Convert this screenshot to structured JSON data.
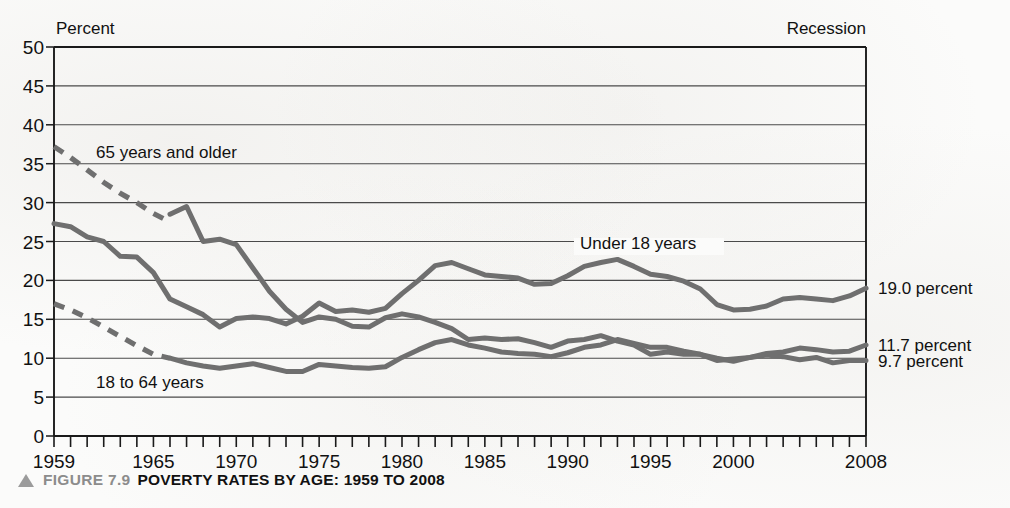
{
  "figure": {
    "marker_icon": "triangle-up-icon",
    "number_label": "FIGURE 7.9",
    "title": "POVERTY RATES BY AGE: 1959 TO 2008"
  },
  "annotations": {
    "y_axis_unit": "Percent",
    "recession_note": "Recession"
  },
  "colors": {
    "page_background": "#fbfbfa",
    "plot_frame": "#1a1a1a",
    "gridline": "#4a4a4a",
    "series_line": "#6f6f6f",
    "text": "#111111",
    "caption_gray": "#8c8c8c"
  },
  "chart_data": {
    "type": "line",
    "title": "POVERTY RATES BY AGE: 1959 TO 2008",
    "xlabel": "",
    "ylabel": "Percent",
    "xlim": [
      1959,
      2008
    ],
    "ylim": [
      0,
      50
    ],
    "ytick_step": 5,
    "grid": true,
    "legend_position": "inline-labels",
    "yticks": [
      0,
      5,
      10,
      15,
      20,
      25,
      30,
      35,
      40,
      45,
      50
    ],
    "xticks_labeled": [
      1959,
      1965,
      1970,
      1975,
      1980,
      1985,
      1990,
      1995,
      2000,
      2008
    ],
    "xticks_all_years": true,
    "x": [
      1959,
      1960,
      1961,
      1962,
      1963,
      1964,
      1965,
      1966,
      1967,
      1968,
      1969,
      1970,
      1971,
      1972,
      1973,
      1974,
      1975,
      1976,
      1977,
      1978,
      1979,
      1980,
      1981,
      1982,
      1983,
      1984,
      1985,
      1986,
      1987,
      1988,
      1989,
      1990,
      1991,
      1992,
      1993,
      1994,
      1995,
      1996,
      1997,
      1998,
      1999,
      2000,
      2001,
      2002,
      2003,
      2004,
      2005,
      2006,
      2007,
      2008
    ],
    "series": [
      {
        "name": "65 years and older",
        "label": "65 years and older",
        "label_anchor_year": 1963,
        "style": "solid-with-dashed-estimate",
        "dashed_x": [
          1959,
          1960,
          1961,
          1962,
          1963,
          1964,
          1965,
          1966
        ],
        "dashed_values": [
          37.2,
          35.8,
          34.2,
          32.6,
          31.2,
          30.0,
          28.6,
          27.5
        ],
        "values": [
          null,
          null,
          null,
          null,
          null,
          null,
          null,
          28.5,
          29.5,
          25.0,
          25.3,
          24.6,
          21.6,
          18.6,
          16.3,
          14.6,
          15.3,
          15.0,
          14.1,
          14.0,
          15.2,
          15.7,
          15.3,
          14.6,
          13.8,
          12.4,
          12.6,
          12.4,
          12.5,
          12.0,
          11.4,
          12.2,
          12.4,
          12.9,
          12.2,
          11.7,
          10.5,
          10.8,
          10.5,
          10.5,
          9.7,
          9.9,
          10.1,
          10.4,
          10.2,
          9.8,
          10.1,
          9.4,
          9.7,
          9.7
        ],
        "end_value_label": "9.7 percent",
        "end_value": 9.7
      },
      {
        "name": "Under 18 years",
        "label": "Under 18 years",
        "label_anchor_year": 1990,
        "style": "solid",
        "values": [
          27.3,
          26.9,
          25.6,
          25.0,
          23.1,
          23.0,
          21.0,
          17.6,
          16.6,
          15.6,
          14.0,
          15.1,
          15.3,
          15.1,
          14.4,
          15.4,
          17.1,
          16.0,
          16.2,
          15.9,
          16.4,
          18.3,
          20.0,
          21.9,
          22.3,
          21.5,
          20.7,
          20.5,
          20.3,
          19.5,
          19.6,
          20.6,
          21.8,
          22.3,
          22.7,
          21.8,
          20.8,
          20.5,
          19.9,
          18.9,
          16.9,
          16.2,
          16.3,
          16.7,
          17.6,
          17.8,
          17.6,
          17.4,
          18.0,
          19.0
        ],
        "end_value_label": "19.0 percent",
        "end_value": 19.0
      },
      {
        "name": "18 to 64 years",
        "label": "18 to 64 years",
        "label_anchor_year": 1964,
        "style": "solid-with-dashed-estimate",
        "dashed_x": [
          1959,
          1960,
          1961,
          1962,
          1963,
          1964,
          1965,
          1966
        ],
        "dashed_values": [
          17.0,
          16.2,
          15.2,
          14.0,
          12.8,
          11.6,
          10.5,
          10.0
        ],
        "values": [
          null,
          null,
          null,
          null,
          null,
          null,
          null,
          10.0,
          9.4,
          9.0,
          8.7,
          9.0,
          9.3,
          8.8,
          8.3,
          8.3,
          9.2,
          9.0,
          8.8,
          8.7,
          8.9,
          10.1,
          11.1,
          12.0,
          12.4,
          11.7,
          11.3,
          10.8,
          10.6,
          10.5,
          10.2,
          10.7,
          11.4,
          11.7,
          12.4,
          11.9,
          11.4,
          11.4,
          10.9,
          10.5,
          10.0,
          9.6,
          10.1,
          10.6,
          10.8,
          11.3,
          11.1,
          10.8,
          10.9,
          11.7
        ],
        "end_value_label": "11.7 percent",
        "end_value": 11.7
      }
    ]
  }
}
